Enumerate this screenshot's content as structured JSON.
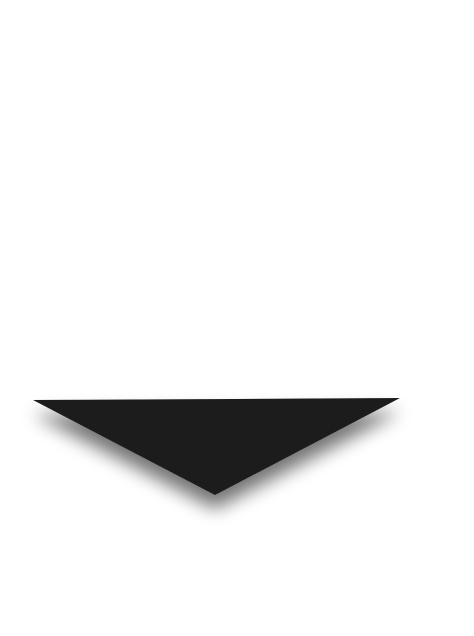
{
  "canvas": {
    "width": 474,
    "height": 636,
    "background": "#ffffff"
  },
  "shape": {
    "type": "down-triangle",
    "fill": "#1c1c1c",
    "shadow_color": "#7a7a7a",
    "vertices": {
      "left": [
        33,
        400
      ],
      "right": [
        400,
        398
      ],
      "bottom": [
        215,
        495
      ]
    }
  }
}
